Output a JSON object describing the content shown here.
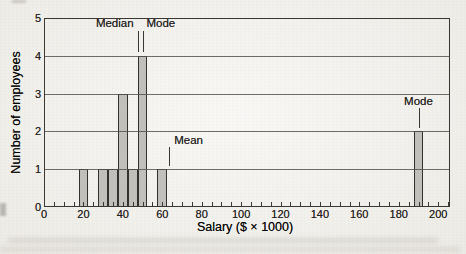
{
  "figure": {
    "background_color": "#f3f1ec",
    "bar_fill": "#c1c0bb",
    "bar_border": "#33312d",
    "grid_color": "#56534d",
    "frame_color": "#3a3733",
    "text_color": "#23211d"
  },
  "chart_data": {
    "type": "bar",
    "title": "",
    "xlabel": "Salary ($ × 1000)",
    "ylabel": "Number of employees",
    "x_values": [
      20,
      30,
      35,
      40,
      45,
      50,
      60,
      190
    ],
    "counts": [
      1,
      1,
      1,
      3,
      1,
      4,
      1,
      2
    ],
    "bin_width": 5,
    "xlim": [
      0,
      206
    ],
    "ylim": [
      0,
      5
    ],
    "x_tick_step_minor": 5,
    "x_tick_step_labeled": 20,
    "x_tick_labels": [
      "0",
      "20",
      "40",
      "60",
      "80",
      "100",
      "120",
      "140",
      "160",
      "180",
      "200"
    ],
    "y_tick_labels": [
      "0",
      "1",
      "2",
      "3",
      "4",
      "5"
    ],
    "grid": "horizontal gridlines at each integer count",
    "legend": "none",
    "annotations": [
      {
        "label": "Median",
        "x": 47.5
      },
      {
        "label": "Mode",
        "x": 50
      },
      {
        "label": "Mean",
        "x": 63.5
      },
      {
        "label": "Mode",
        "x": 190
      }
    ]
  }
}
